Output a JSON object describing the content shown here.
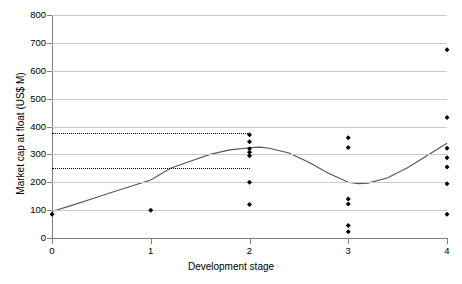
{
  "chart_data": {
    "type": "scatter",
    "title": "",
    "xlabel": "Development stage",
    "ylabel": "Market cap at float (US$ M)",
    "xlim": [
      0,
      4
    ],
    "ylim": [
      0,
      800
    ],
    "xticks": [
      "0",
      "1",
      "2",
      "3",
      "4"
    ],
    "yticks": [
      "0",
      "100",
      "200",
      "300",
      "400",
      "500",
      "600",
      "700",
      "800"
    ],
    "grid": true,
    "legend": "none",
    "series": [
      {
        "name": "Observations",
        "marker": "filled-diamond",
        "color": "#000000",
        "points": [
          {
            "x": 0,
            "y": 85
          },
          {
            "x": 1,
            "y": 100
          },
          {
            "x": 2,
            "y": 370
          },
          {
            "x": 2,
            "y": 345
          },
          {
            "x": 2,
            "y": 320
          },
          {
            "x": 2,
            "y": 308
          },
          {
            "x": 2,
            "y": 295
          },
          {
            "x": 2,
            "y": 200
          },
          {
            "x": 2,
            "y": 120
          },
          {
            "x": 3,
            "y": 360
          },
          {
            "x": 3,
            "y": 325
          },
          {
            "x": 3,
            "y": 140
          },
          {
            "x": 3,
            "y": 122
          },
          {
            "x": 3,
            "y": 45
          },
          {
            "x": 3,
            "y": 22
          },
          {
            "x": 4,
            "y": 675
          },
          {
            "x": 4,
            "y": 432
          },
          {
            "x": 4,
            "y": 322
          },
          {
            "x": 4,
            "y": 288
          },
          {
            "x": 4,
            "y": 255
          },
          {
            "x": 4,
            "y": 195
          },
          {
            "x": 4,
            "y": 85
          }
        ]
      },
      {
        "name": "Fitted trend",
        "marker": "none",
        "style": "solid-line",
        "color": "#555555",
        "x": [
          0.0,
          0.2,
          0.4,
          0.6,
          0.8,
          1.0,
          1.2,
          1.4,
          1.6,
          1.8,
          2.0,
          2.1,
          2.2,
          2.4,
          2.6,
          2.8,
          3.0,
          3.1,
          3.2,
          3.4,
          3.6,
          3.8,
          4.0
        ],
        "y": [
          95,
          117,
          140,
          163,
          186,
          208,
          250,
          275,
          300,
          316,
          324,
          326,
          322,
          305,
          272,
          232,
          200,
          195,
          197,
          216,
          252,
          296,
          340
        ]
      }
    ],
    "reference_lines": [
      {
        "name": "upper-reference",
        "y": 378,
        "x_from": 0,
        "x_to": 2,
        "style": "dotted",
        "color": "#000000"
      },
      {
        "name": "lower-reference",
        "y": 250,
        "x_from": 0,
        "x_to": 2,
        "style": "dotted",
        "color": "#000000"
      }
    ]
  }
}
